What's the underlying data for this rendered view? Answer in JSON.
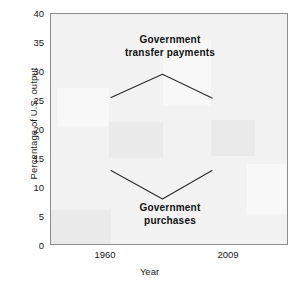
{
  "chart_data": {
    "type": "line",
    "title": "",
    "xlabel": "Year",
    "ylabel": "Percentage of U.S. output",
    "ylim": [
      0,
      40
    ],
    "yticks": [
      0,
      5,
      10,
      15,
      20,
      25,
      30,
      35,
      40
    ],
    "ytick_labels": [
      "0",
      "5",
      "10",
      "15",
      "20",
      "25",
      "30",
      "35",
      "40"
    ],
    "xticks": [
      1960,
      2009
    ],
    "xtick_labels": [
      "1960",
      "2009"
    ],
    "grid": false,
    "legend": "none",
    "series": [
      {
        "name": "Government transfer payments",
        "x": [
          1960,
          1985,
          2009
        ],
        "values": [
          25.6,
          29.6,
          25.5
        ],
        "color": "#2b2b2b"
      },
      {
        "name": "Government purchases",
        "x": [
          1960,
          1985,
          2009
        ],
        "values": [
          13.0,
          8.1,
          13.0
        ],
        "color": "#2b2b2b"
      }
    ],
    "annotations": [
      {
        "name": "transfer-payments-label",
        "line1": "Government",
        "line2": "transfer payments"
      },
      {
        "name": "purchases-label",
        "line1": "Government",
        "line2": "purchases"
      }
    ]
  },
  "axes": {
    "ylabel": "Percentage of U.S. output",
    "xlabel": "Year",
    "ytick_0": "0",
    "ytick_5": "5",
    "ytick_10": "10",
    "ytick_15": "15",
    "ytick_20": "20",
    "ytick_25": "25",
    "ytick_30": "30",
    "ytick_35": "35",
    "ytick_40": "40",
    "xtick_1960": "1960",
    "xtick_2009": "2009"
  },
  "annotations": {
    "transfer_line1": "Government",
    "transfer_line2": "transfer payments",
    "purchases_line1": "Government",
    "purchases_line2": "purchases"
  },
  "colors": {
    "line": "#2b2b2b",
    "frame": "#8d8d8d",
    "plot_bg": "#f2f2f2",
    "text": "#1a1a1a"
  }
}
